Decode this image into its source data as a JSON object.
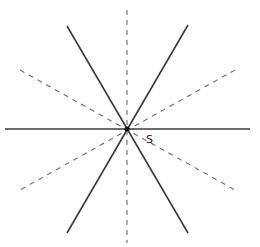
{
  "diagram": {
    "center": {
      "x": 127,
      "y": 129
    },
    "center_label": "S",
    "colors": {
      "solid": "#3a3a3a",
      "dashed": "#777777",
      "point": "#111111",
      "background": "#ffffff"
    },
    "solid_lines": [
      {
        "name": "horizontal-line",
        "x1": 5,
        "y1": 129,
        "x2": 250,
        "y2": 129
      },
      {
        "name": "steep-line-positive",
        "x1": 67,
        "y1": 26,
        "x2": 188,
        "y2": 233
      },
      {
        "name": "steep-line-negative",
        "x1": 188,
        "y1": 25,
        "x2": 67,
        "y2": 233
      }
    ],
    "dashed_lines": [
      {
        "name": "vertical-dashed-line",
        "x1": 127,
        "y1": 10,
        "x2": 127,
        "y2": 243
      },
      {
        "name": "shallow-dashed-line-negative",
        "x1": 20,
        "y1": 70,
        "x2": 235,
        "y2": 190
      },
      {
        "name": "shallow-dashed-line-positive",
        "x1": 235,
        "y1": 70,
        "x2": 20,
        "y2": 190
      }
    ]
  }
}
